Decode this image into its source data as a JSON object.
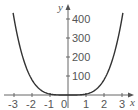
{
  "chart_data": {
    "type": "line",
    "title": "",
    "xlabel": "x",
    "ylabel": "y",
    "xlim": [
      -3.2,
      3.2
    ],
    "ylim": [
      0,
      420
    ],
    "x_ticks": [
      -3,
      -2,
      -1,
      0,
      1,
      2,
      3
    ],
    "x_tick_labels": [
      "-3",
      "-2",
      "-1",
      "0",
      "1",
      "2",
      "3"
    ],
    "y_ticks": [
      100,
      200,
      300,
      400
    ],
    "y_tick_labels": [
      "100",
      "200",
      "300",
      "400"
    ],
    "grid": false,
    "legend": null,
    "series": [
      {
        "name": "y = 5x^4",
        "x": [
          -3,
          -2.5,
          -2,
          -1.5,
          -1,
          -0.5,
          0,
          0.5,
          1,
          1.5,
          2,
          2.5,
          3
        ],
        "y": [
          405,
          195.3,
          80,
          25.3,
          5,
          0.3,
          0,
          0.3,
          5,
          25.3,
          80,
          195.3,
          405
        ]
      }
    ],
    "colors": {
      "curve": "#333333",
      "axis": "#555555"
    }
  }
}
